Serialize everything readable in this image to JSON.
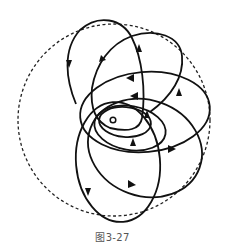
{
  "figure": {
    "caption": "图3-27",
    "stroke_color": "#111111",
    "dashed_color": "#222222",
    "center_marker": "small circle at origin"
  }
}
